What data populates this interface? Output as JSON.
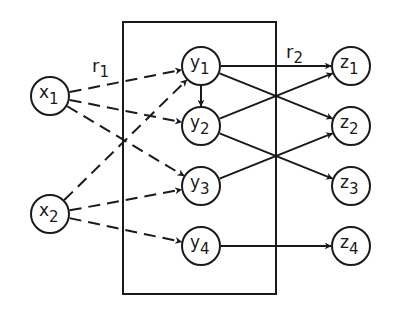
{
  "diagram": {
    "type": "layered network (mapping diagram)",
    "box": {
      "x": 123,
      "y": 22,
      "w": 153,
      "h": 272
    },
    "labels": [
      {
        "id": "r1",
        "base": "r",
        "sub": "1",
        "x": 92,
        "y": 72
      },
      {
        "id": "r2",
        "base": "r",
        "sub": "2",
        "x": 286,
        "y": 58
      }
    ],
    "nodes": [
      {
        "id": "x1",
        "base": "x",
        "sub": "1",
        "cx": 50,
        "cy": 96
      },
      {
        "id": "x2",
        "base": "x",
        "sub": "2",
        "cx": 50,
        "cy": 214
      },
      {
        "id": "y1",
        "base": "y",
        "sub": "1",
        "cx": 201,
        "cy": 66
      },
      {
        "id": "y2",
        "base": "y",
        "sub": "2",
        "cx": 201,
        "cy": 126
      },
      {
        "id": "y3",
        "base": "y",
        "sub": "3",
        "cx": 201,
        "cy": 186
      },
      {
        "id": "y4",
        "base": "y",
        "sub": "4",
        "cx": 201,
        "cy": 246
      },
      {
        "id": "z1",
        "base": "z",
        "sub": "1",
        "cx": 351,
        "cy": 66
      },
      {
        "id": "z2",
        "base": "z",
        "sub": "2",
        "cx": 351,
        "cy": 126
      },
      {
        "id": "z3",
        "base": "z",
        "sub": "3",
        "cx": 351,
        "cy": 186
      },
      {
        "id": "z4",
        "base": "z",
        "sub": "4",
        "cx": 351,
        "cy": 246
      }
    ],
    "edges": [
      {
        "from": "x1",
        "to": "y1",
        "style": "dashed",
        "relation": "r1"
      },
      {
        "from": "x1",
        "to": "y2",
        "style": "dashed",
        "relation": "r1"
      },
      {
        "from": "x1",
        "to": "y3",
        "style": "dashed",
        "relation": "r1"
      },
      {
        "from": "x2",
        "to": "y1",
        "style": "dashed",
        "relation": "r1"
      },
      {
        "from": "x2",
        "to": "y3",
        "style": "dashed",
        "relation": "r1"
      },
      {
        "from": "x2",
        "to": "y4",
        "style": "dashed",
        "relation": "r1"
      },
      {
        "from": "y1",
        "to": "y2",
        "style": "solid"
      },
      {
        "from": "y1",
        "to": "z1",
        "style": "solid",
        "relation": "r2"
      },
      {
        "from": "y1",
        "to": "z2",
        "style": "solid",
        "relation": "r2"
      },
      {
        "from": "y2",
        "to": "z1",
        "style": "solid",
        "relation": "r2"
      },
      {
        "from": "y2",
        "to": "z3",
        "style": "solid",
        "relation": "r2"
      },
      {
        "from": "y3",
        "to": "z2",
        "style": "solid",
        "relation": "r2"
      },
      {
        "from": "y4",
        "to": "z4",
        "style": "solid",
        "relation": "r2"
      }
    ],
    "node_radius": 19,
    "colors": {
      "ink": "#1a1a1a",
      "background": "#ffffff"
    }
  }
}
